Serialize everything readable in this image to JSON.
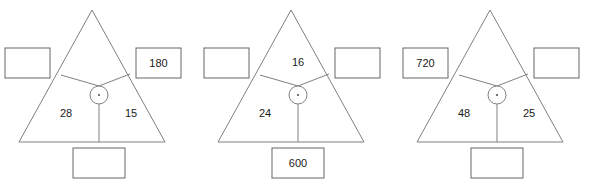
{
  "worksheet": {
    "title": "Multiplication triangle puzzles",
    "operator_symbol": "·",
    "operator_name": "multiplication-dot",
    "line_color": "#808080",
    "box_border_color": "#666666",
    "text_color": "#1a1a1a",
    "background_color": "#ffffff"
  },
  "puzzles": [
    {
      "id": "puzzle-1",
      "regions": {
        "top": "",
        "bottom_left": "28",
        "bottom_right": "15"
      },
      "boxes": {
        "left": "",
        "right": "180",
        "bottom": ""
      }
    },
    {
      "id": "puzzle-2",
      "regions": {
        "top": "16",
        "bottom_left": "24",
        "bottom_right": ""
      },
      "boxes": {
        "left": "",
        "right": "",
        "bottom": "600"
      }
    },
    {
      "id": "puzzle-3",
      "regions": {
        "top": "",
        "bottom_left": "48",
        "bottom_right": "25"
      },
      "boxes": {
        "left": "720",
        "right": "",
        "bottom": ""
      }
    }
  ]
}
